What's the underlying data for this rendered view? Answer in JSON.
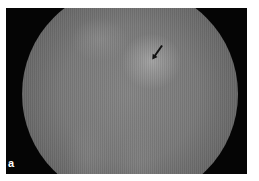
{
  "figure": {
    "panel_label": "a",
    "colors": {
      "background": "#ffffff",
      "frame": "#050505",
      "label": "#ffffff",
      "arrow": "#111111"
    }
  }
}
